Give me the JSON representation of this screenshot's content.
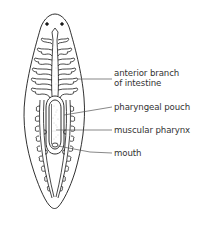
{
  "diagram": {
    "labels": [
      {
        "id": "anterior-branch",
        "line1": "anterior branch",
        "line2": "of intestine"
      },
      {
        "id": "pharyngeal-pouch",
        "line1": "pharyngeal pouch"
      },
      {
        "id": "muscular-pharynx",
        "line1": "muscular pharynx"
      },
      {
        "id": "mouth",
        "line1": "mouth"
      }
    ],
    "colors": {
      "background": "#ffffff",
      "outline": "#1a1a1a",
      "leader_line": "#555555",
      "text": "#333333",
      "stipple": "#bbbbbb"
    }
  }
}
